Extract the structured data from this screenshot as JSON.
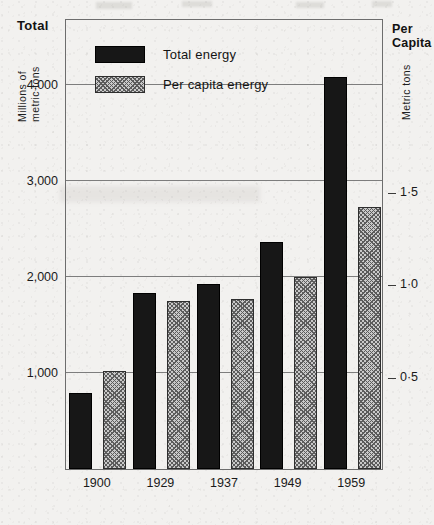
{
  "chart_data": {
    "type": "bar",
    "title": "",
    "subtitle": "",
    "categories": [
      "1900",
      "1929",
      "1937",
      "1949",
      "1959"
    ],
    "series": [
      {
        "name": "Total energy",
        "axis": "left",
        "values": [
          790,
          1830,
          1930,
          2370,
          4090
        ]
      },
      {
        "name": "Per capita energy",
        "axis": "right",
        "values": [
          0.53,
          0.91,
          0.92,
          1.04,
          1.42
        ]
      }
    ],
    "left_axis": {
      "label_bold": "Total",
      "label_unit_line1": "Millions of",
      "label_unit_line2": "metric tons",
      "ticks": [
        "1,000",
        "2,000",
        "3,000",
        "4,000"
      ],
      "tick_values": [
        1000,
        2000,
        3000,
        4000
      ],
      "ylim": [
        0,
        4700
      ]
    },
    "right_axis": {
      "label_bold_line1": "Per",
      "label_bold_line2": "Capita",
      "label_unit": "Metric tons",
      "ticks": [
        "0·5",
        "1·0",
        "1·5"
      ],
      "tick_values": [
        0.5,
        1.0,
        1.5
      ],
      "ylim": [
        0,
        2.44
      ]
    },
    "legend": {
      "position": "inside-top-left",
      "entries": [
        {
          "label": "Total energy",
          "swatch": "solid-black"
        },
        {
          "label": "Per capita energy",
          "swatch": "hatched-gray"
        }
      ]
    },
    "grid": {
      "horizontal": true,
      "vertical": false
    },
    "xlabel": "",
    "ylabel": "Millions of metric tons"
  }
}
